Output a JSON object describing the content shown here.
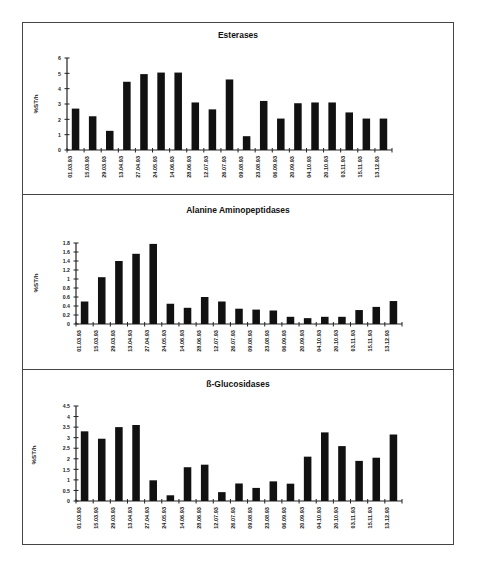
{
  "categories": [
    "01.03.93",
    "15.03.93",
    "29.03.93",
    "13.04.93",
    "27.04.93",
    "24.05.93",
    "14.06.93",
    "28.06.93",
    "12.07.93",
    "26.07.93",
    "09.08.93",
    "23.08.93",
    "06.09.93",
    "20.09.93",
    "04.10.93",
    "20.10.93",
    "03.11.93",
    "15.11.93",
    "13.12.93"
  ],
  "panels": [
    {
      "title": "Esterases",
      "ylabel": "%ST/h"
    },
    {
      "title": "Alanine Aminopeptidases",
      "ylabel": "%ST/h"
    },
    {
      "title": "ß-Glucosidases",
      "ylabel": "%ST/h"
    }
  ],
  "chart_data": [
    {
      "type": "bar",
      "title": "Esterases",
      "xlabel": "",
      "ylabel": "%ST/h",
      "ylim": [
        0,
        6
      ],
      "yticks": [
        0,
        1,
        2,
        3,
        4,
        5,
        6
      ],
      "ytick_labels": [
        "0",
        "1",
        "2",
        "3",
        "4",
        "5",
        "6"
      ],
      "grid": false,
      "legend": null,
      "categories": [
        "01.03.93",
        "15.03.93",
        "29.03.93",
        "13.04.93",
        "27.04.93",
        "24.05.93",
        "14.06.93",
        "28.06.93",
        "12.07.93",
        "26.07.93",
        "09.08.93",
        "23.08.93",
        "06.09.93",
        "20.09.93",
        "04.10.93",
        "20.10.93",
        "03.11.93",
        "15.11.93",
        "13.12.93"
      ],
      "values": [
        2.7,
        2.2,
        1.25,
        4.45,
        4.95,
        5.05,
        5.05,
        3.1,
        2.65,
        4.6,
        0.9,
        3.2,
        2.05,
        3.05,
        3.1,
        3.1,
        2.45,
        2.05,
        2.05
      ]
    },
    {
      "type": "bar",
      "title": "Alanine Aminopeptidases",
      "xlabel": "",
      "ylabel": "%ST/h",
      "ylim": [
        0,
        1.8
      ],
      "yticks": [
        0,
        0.2,
        0.4,
        0.6,
        0.8,
        1,
        1.2,
        1.4,
        1.6,
        1.8
      ],
      "ytick_labels": [
        "0",
        "0.2",
        "0.4",
        "0.6",
        "0.8",
        "1",
        "1.2",
        "1.4",
        "1.6",
        "1.8"
      ],
      "grid": false,
      "legend": null,
      "categories": [
        "01.03.93",
        "15.03.93",
        "29.03.93",
        "13.04.93",
        "27.04.93",
        "24.05.93",
        "14.06.93",
        "28.06.93",
        "12.07.93",
        "26.07.93",
        "09.08.93",
        "23.08.93",
        "06.09.93",
        "20.09.93",
        "04.10.93",
        "20.10.93",
        "03.11.93",
        "15.11.93",
        "13.12.93"
      ],
      "values": [
        0.5,
        1.04,
        1.4,
        1.56,
        1.78,
        0.45,
        0.36,
        0.6,
        0.5,
        0.34,
        0.32,
        0.3,
        0.16,
        0.13,
        0.16,
        0.16,
        0.31,
        0.38,
        0.51
      ]
    },
    {
      "type": "bar",
      "title": "ß-Glucosidases",
      "xlabel": "",
      "ylabel": "%ST/h",
      "ylim": [
        0,
        4.5
      ],
      "yticks": [
        0,
        0.5,
        1,
        1.5,
        2,
        2.5,
        3,
        3.5,
        4,
        4.5
      ],
      "ytick_labels": [
        "0",
        "0.5",
        "1",
        "1.5",
        "2",
        "2.5",
        "3",
        "3.5",
        "4",
        "4.5"
      ],
      "grid": false,
      "legend": null,
      "categories": [
        "01.03.93",
        "15.03.93",
        "29.03.93",
        "13.04.93",
        "27.04.93",
        "24.05.93",
        "14.06.93",
        "28.06.93",
        "12.07.93",
        "26.07.93",
        "09.08.93",
        "23.08.93",
        "06.09.93",
        "20.09.93",
        "04.10.93",
        "20.10.93",
        "03.11.93",
        "15.11.93",
        "13.12.93"
      ],
      "values": [
        3.3,
        2.95,
        3.5,
        3.6,
        0.98,
        0.27,
        1.6,
        1.72,
        0.42,
        0.83,
        0.62,
        0.93,
        0.82,
        2.1,
        3.25,
        2.6,
        1.9,
        2.05,
        3.15
      ]
    }
  ],
  "style": {
    "bar_color": "#111111",
    "axis_color": "#222222",
    "frame_color": "#444444"
  }
}
